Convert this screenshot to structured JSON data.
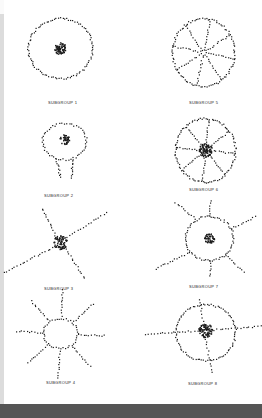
{
  "figure": {
    "panels": [
      {
        "label": "SUBGROUP 1",
        "shape": "ring-with-center-cluster",
        "cx": 60,
        "cy": 48,
        "r": 32,
        "spokes": 0
      },
      {
        "label": "SUBGROUP 5",
        "shape": "wheel-with-spokes",
        "cx": 203,
        "cy": 52,
        "r": 31,
        "spokes": 8
      },
      {
        "label": "SUBGROUP 2",
        "shape": "ring-with-stem",
        "cx": 64,
        "cy": 141,
        "r": 21,
        "spokes": 0
      },
      {
        "label": "SUBGROUP 6",
        "shape": "wheel-with-spokes-dense-center",
        "cx": 205,
        "cy": 150,
        "r": 32,
        "spokes": 8
      },
      {
        "label": "SUBGROUP 3",
        "shape": "star-no-ring",
        "cx": 60,
        "cy": 242,
        "r": 0,
        "spokes": 4
      },
      {
        "label": "SUBGROUP 7",
        "shape": "octagon-with-rays",
        "cx": 209,
        "cy": 238,
        "r": 24,
        "spokes": 6
      },
      {
        "label": "SUBGROUP 4",
        "shape": "ring-with-rays",
        "cx": 60,
        "cy": 333,
        "r": 17,
        "spokes": 8
      },
      {
        "label": "SUBGROUP 8",
        "shape": "ring-with-cross",
        "cx": 205,
        "cy": 332,
        "r": 28,
        "spokes": 4
      }
    ],
    "label_positions": [
      [
        48,
        104
      ],
      [
        189,
        104
      ],
      [
        44,
        197
      ],
      [
        189,
        191
      ],
      [
        44,
        290
      ],
      [
        189,
        288
      ],
      [
        46,
        384
      ],
      [
        188,
        385
      ]
    ]
  },
  "colors": {
    "ink": "#1a1a1a",
    "paper": "#ffffff",
    "left_strip": "#dcdcdc",
    "bottom_band": "#555555"
  }
}
